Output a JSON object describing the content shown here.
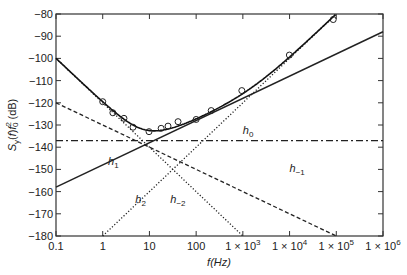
{
  "chart_data": {
    "type": "line",
    "title": "",
    "xlabel": "f(Hz)",
    "ylabel": "S_y(f) f_0^2 (dB)",
    "xscale": "log",
    "xlim": [
      0.1,
      1000000
    ],
    "ylim": [
      -180,
      -80
    ],
    "grid": false,
    "legend": "none (inline curve labels)",
    "x_ticks": [
      0.1,
      1,
      10,
      100,
      1000,
      10000,
      100000,
      1000000
    ],
    "x_tick_labels": [
      "0.1",
      "1",
      "10",
      "100",
      "1 × 10^3",
      "1 × 10^4",
      "1 × 10^5",
      "1 × 10^6"
    ],
    "y_ticks": [
      -80,
      -90,
      -100,
      -110,
      -120,
      -130,
      -140,
      -150,
      -160,
      -170,
      -180
    ],
    "y_tick_labels": [
      "−80",
      "−90",
      "−100",
      "−110",
      "−120",
      "−130",
      "−140",
      "−150",
      "−160",
      "−170",
      "−180"
    ],
    "series": [
      {
        "name": "h0",
        "label": "h",
        "sub": "0",
        "style": "dashdot",
        "slope_db_per_decade": 0,
        "x": [
          0.1,
          1000000
        ],
        "values": [
          -137,
          -137
        ],
        "label_pos": [
          1000,
          -134
        ]
      },
      {
        "name": "h1",
        "label": "h",
        "sub": "1",
        "style": "solid",
        "slope_db_per_decade": 10,
        "x": [
          0.1,
          1000000
        ],
        "values": [
          -158,
          -88
        ],
        "label_pos": [
          1.3,
          -148
        ]
      },
      {
        "name": "h-1",
        "label": "h",
        "sub": "−1",
        "style": "dashed",
        "slope_db_per_decade": -10,
        "x": [
          0.1,
          100000
        ],
        "values": [
          -120,
          -180
        ],
        "label_pos": [
          10000,
          -151
        ]
      },
      {
        "name": "h2",
        "label": "h",
        "sub": "2",
        "style": "dotted",
        "slope_db_per_decade": 20,
        "x": [
          1,
          100000
        ],
        "values": [
          -180,
          -80
        ],
        "label_pos": [
          5,
          -165
        ]
      },
      {
        "name": "h-2",
        "label": "h",
        "sub": "−2",
        "style": "dotted",
        "slope_db_per_decade": -20,
        "x": [
          0.1,
          1000
        ],
        "values": [
          -100,
          -180
        ],
        "label_pos": [
          28,
          -165
        ]
      },
      {
        "name": "total",
        "style": "solid-bold",
        "description": "sum of power-law noise components"
      }
    ],
    "measured_points": {
      "marker": "circle",
      "x": [
        1,
        1.65,
        2.85,
        4.45,
        9.8,
        17.8,
        25,
        41,
        100,
        210,
        950,
        9900,
        86000
      ],
      "values": [
        -119.5,
        -124.5,
        -127,
        -131,
        -133,
        -131.5,
        -130.5,
        -128.5,
        -127.5,
        -123.5,
        -114.5,
        -98.5,
        -82.5
      ]
    }
  }
}
